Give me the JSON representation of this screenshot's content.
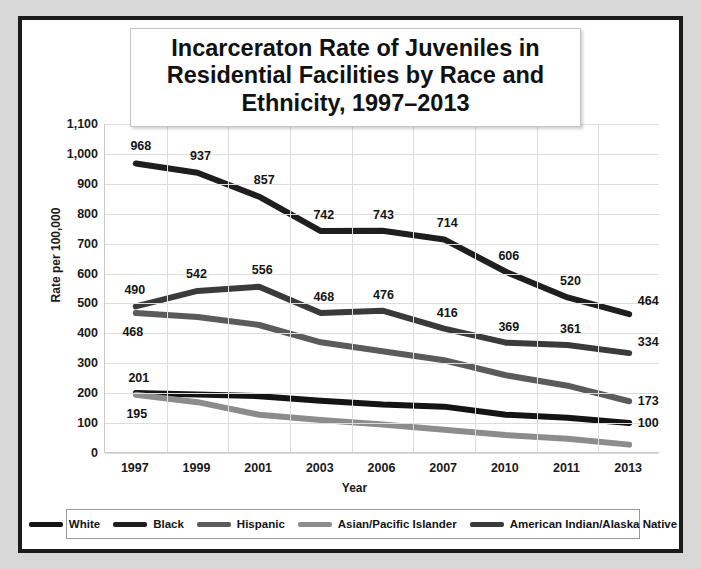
{
  "chart_data": {
    "type": "line",
    "title": "Incarceraton Rate of Juveniles in Residential Facilities by Race and Ethnicity, 1997–2013",
    "xlabel": "Year",
    "ylabel": "Rate per 100,000",
    "categories": [
      "1997",
      "1999",
      "2001",
      "2003",
      "2006",
      "2007",
      "2010",
      "2011",
      "2013"
    ],
    "ylim": [
      0,
      1100
    ],
    "yticks": [
      "0",
      "100",
      "200",
      "300",
      "400",
      "500",
      "600",
      "700",
      "800",
      "900",
      "1,000",
      "1,100"
    ],
    "ytick_values": [
      0,
      100,
      200,
      300,
      400,
      500,
      600,
      700,
      800,
      900,
      1000,
      1100
    ],
    "grid": true,
    "legend_position": "bottom",
    "series": [
      {
        "name": "White",
        "color": "#141414",
        "values": [
          201,
          196,
          190,
          175,
          162,
          155,
          128,
          118,
          100
        ],
        "labels": [
          {
            "index": 0,
            "text": "201",
            "dx": 4,
            "dy": -15
          },
          {
            "index": 8,
            "text": "100",
            "dx": 20,
            "dy": 0
          }
        ]
      },
      {
        "name": "Black",
        "color": "#1e1e1e",
        "values": [
          968,
          937,
          857,
          742,
          743,
          714,
          606,
          520,
          464
        ],
        "labels": [
          {
            "index": 0,
            "text": "968",
            "dx": 6,
            "dy": -17
          },
          {
            "index": 1,
            "text": "937",
            "dx": 4,
            "dy": -17
          },
          {
            "index": 2,
            "text": "857",
            "dx": 6,
            "dy": -17
          },
          {
            "index": 3,
            "text": "742",
            "dx": 4,
            "dy": -16
          },
          {
            "index": 4,
            "text": "743",
            "dx": 2,
            "dy": -16
          },
          {
            "index": 5,
            "text": "714",
            "dx": 4,
            "dy": -16
          },
          {
            "index": 6,
            "text": "606",
            "dx": 4,
            "dy": -16
          },
          {
            "index": 7,
            "text": "520",
            "dx": 4,
            "dy": -16
          },
          {
            "index": 8,
            "text": "464",
            "dx": 20,
            "dy": -13
          }
        ]
      },
      {
        "name": "Hispanic",
        "color": "#5b5b5b",
        "values": [
          468,
          455,
          428,
          370,
          340,
          310,
          260,
          225,
          173
        ],
        "labels": [
          {
            "index": 0,
            "text": "468",
            "dx": -2,
            "dy": 19
          },
          {
            "index": 8,
            "text": "173",
            "dx": 20,
            "dy": 0
          }
        ]
      },
      {
        "name": "Asian/Pacific Islander",
        "color": "#8c8c8c",
        "values": [
          195,
          170,
          128,
          110,
          95,
          78,
          60,
          48,
          28
        ],
        "labels": [
          {
            "index": 0,
            "text": "195",
            "dx": 2,
            "dy": 19
          }
        ]
      },
      {
        "name": "American Indian/Alaska Native",
        "color": "#3a3a3a",
        "values": [
          490,
          542,
          556,
          468,
          476,
          416,
          369,
          361,
          334
        ],
        "labels": [
          {
            "index": 0,
            "text": "490",
            "dx": 0,
            "dy": -16
          },
          {
            "index": 1,
            "text": "542",
            "dx": 0,
            "dy": -17
          },
          {
            "index": 2,
            "text": "556",
            "dx": 4,
            "dy": -17
          },
          {
            "index": 3,
            "text": "468",
            "dx": 4,
            "dy": -16
          },
          {
            "index": 4,
            "text": "476",
            "dx": 2,
            "dy": -16
          },
          {
            "index": 5,
            "text": "416",
            "dx": 4,
            "dy": -16
          },
          {
            "index": 6,
            "text": "369",
            "dx": 4,
            "dy": -16
          },
          {
            "index": 7,
            "text": "361",
            "dx": 4,
            "dy": -16
          },
          {
            "index": 8,
            "text": "334",
            "dx": 20,
            "dy": -11
          }
        ]
      }
    ]
  }
}
